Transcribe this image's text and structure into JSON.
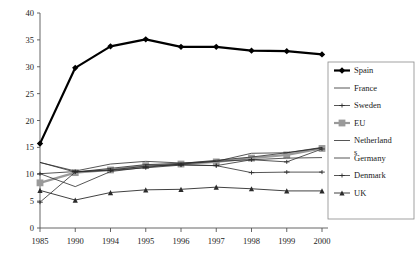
{
  "chart_data": {
    "type": "line",
    "title": "",
    "subtitle": "",
    "xlabel": "",
    "ylabel": "",
    "categories": [
      "1985",
      "1990",
      "1994",
      "1995",
      "1996",
      "1997",
      "1998",
      "1999",
      "2000"
    ],
    "xlim": [
      0,
      8
    ],
    "ylim": [
      0,
      40
    ],
    "ytick_values": [
      0,
      5,
      10,
      15,
      20,
      25,
      30,
      35,
      40
    ],
    "ytick_labels": [
      "0",
      "5",
      "10",
      "15",
      "20",
      "25",
      "30",
      "35",
      "40"
    ],
    "grid": false,
    "legend_position": "right",
    "series": [
      {
        "name": "Spain",
        "color": "#000000",
        "width": 2.2,
        "marker": "diamond",
        "marker_size": 3.2,
        "values": [
          15.7,
          29.8,
          33.8,
          35.1,
          33.7,
          33.7,
          33.0,
          32.9,
          32.3
        ]
      },
      {
        "name": "France",
        "color": "#2b2b2b",
        "width": 0.8,
        "marker": "none",
        "marker_size": 0,
        "values": [
          12.2,
          10.4,
          11.1,
          11.8,
          12.0,
          12.6,
          13.2,
          14.0,
          15.0
        ]
      },
      {
        "name": "Sweden",
        "color": "#2b2b2b",
        "width": 0.8,
        "marker": "plus",
        "marker_size": 2.0,
        "values": [
          4.8,
          10.4,
          10.8,
          11.5,
          11.8,
          11.6,
          12.7,
          12.3,
          14.7
        ]
      },
      {
        "name": "EU",
        "color": "#9a9a9a",
        "width": 2.2,
        "marker": "square",
        "marker_size": 3.4,
        "values": [
          8.4,
          10.3,
          10.8,
          11.6,
          11.9,
          12.3,
          13.0,
          13.6,
          14.8
        ]
      },
      {
        "name": "Netherlands",
        "color": "#2b2b2b",
        "width": 0.8,
        "marker": "none",
        "marker_size": 0,
        "values": [
          10.1,
          7.7,
          10.5,
          11.3,
          11.9,
          12.4,
          12.7,
          13.0,
          13.1
        ]
      },
      {
        "name": "Germany",
        "color": "#2b2b2b",
        "width": 0.8,
        "marker": "none",
        "marker_size": 0,
        "values": [
          12.2,
          10.6,
          11.9,
          12.4,
          12.1,
          12.4,
          13.9,
          14.0,
          14.9
        ]
      },
      {
        "name": "Denmark",
        "color": "#2b2b2b",
        "width": 0.8,
        "marker": "plus",
        "marker_size": 2.0,
        "values": [
          10.1,
          10.5,
          10.7,
          11.2,
          11.7,
          11.6,
          10.3,
          10.4,
          10.4
        ]
      },
      {
        "name": "UK",
        "color": "#2b2b2b",
        "width": 0.9,
        "marker": "triangle",
        "marker_size": 2.6,
        "values": [
          7.0,
          5.2,
          6.6,
          7.1,
          7.2,
          7.6,
          7.3,
          6.9,
          6.9
        ]
      }
    ]
  },
  "legend": {
    "entries": [
      {
        "label": "Spain"
      },
      {
        "label": "France"
      },
      {
        "label": "Sweden"
      },
      {
        "label": "EU"
      },
      {
        "label": "Netherland"
      },
      {
        "label": "s"
      },
      {
        "label": "Germany"
      },
      {
        "label": "Denmark"
      },
      {
        "label": "UK"
      }
    ]
  }
}
